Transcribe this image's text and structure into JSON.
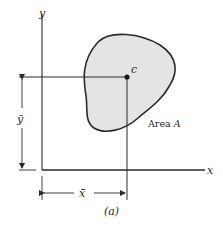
{
  "figure": {
    "caption": "(a)",
    "axes": {
      "x_label": "x",
      "y_label": "y"
    },
    "centroid_label": "c",
    "area_label": "Area A",
    "dimensions": {
      "x_bar": "x̄",
      "y_bar": "ȳ"
    },
    "colors": {
      "area_fill": "#e4e4e4",
      "stroke": "#2a2a2a",
      "background": "#ffffff"
    }
  }
}
